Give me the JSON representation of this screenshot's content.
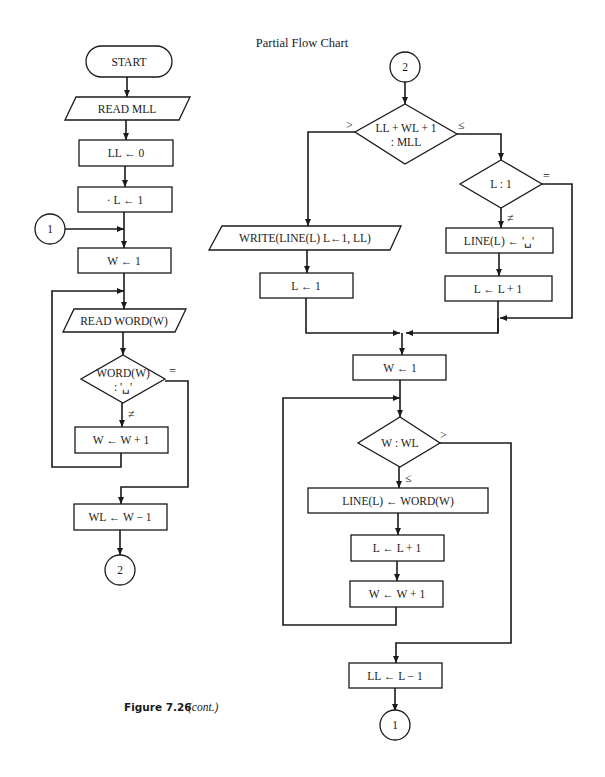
{
  "title": "Partial Flow Chart",
  "caption": {
    "figure": "Figure 7.26",
    "note": "(cont.)"
  },
  "left_flow": {
    "start": "START",
    "read_mll": "READ MLL",
    "ll_init": "LL ← 0",
    "l_init": "· L ← 1",
    "connector_in": "1",
    "w_init": "W ← 1",
    "read_word": "READ WORD(W)",
    "decision_line1": "WORD(W)",
    "decision_line2": ": '␣'",
    "decision_eq": "=",
    "decision_ne": "≠",
    "w_inc": "W ← W + 1",
    "wl_set": "WL ← W − 1",
    "connector_out": "2"
  },
  "right_flow": {
    "connector_in": "2",
    "decision1_line1": "LL + WL + 1",
    "decision1_line2": ": MLL",
    "decision1_gt": ">",
    "decision1_le": "≤",
    "write_line": "WRITE(LINE(L) L←1, LL)",
    "l_reset": "L ← 1",
    "decision2": "L : 1",
    "decision2_eq": "=",
    "decision2_ne": "≠",
    "line_blank": "LINE(L) ← '␣'",
    "l_inc_a": "L ← L + 1",
    "w_init": "W ← 1",
    "decision3": "W : WL",
    "decision3_gt": ">",
    "decision3_le": "≤",
    "line_word": "LINE(L) ← WORD(W)",
    "l_inc_b": "L ← L + 1",
    "w_inc": "W ← W + 1",
    "ll_set": "LL ← L − 1",
    "connector_out": "1"
  }
}
